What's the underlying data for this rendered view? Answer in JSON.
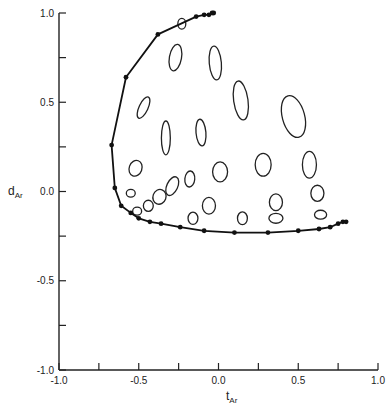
{
  "chart_data": {
    "type": "scatter",
    "title": "",
    "xlabel": "t",
    "xlabel_sub": "Ar",
    "ylabel": "d",
    "ylabel_sub": "Ar",
    "xlim": [
      -1.0,
      1.0
    ],
    "ylim": [
      -1.0,
      1.0
    ],
    "grid": false,
    "x_ticks": [
      -1.0,
      -0.75,
      -0.5,
      -0.25,
      0.0,
      0.25,
      0.5,
      0.75,
      1.0
    ],
    "x_tick_labels": [
      {
        "value": -1.0,
        "label": "-1.0"
      },
      {
        "value": -0.5,
        "label": "-0.5"
      },
      {
        "value": 0.0,
        "label": "0.0"
      },
      {
        "value": 0.5,
        "label": "0.5"
      },
      {
        "value": 1.0,
        "label": "1.0"
      }
    ],
    "y_ticks": [
      -1.0,
      -0.75,
      -0.5,
      -0.25,
      0.0,
      0.25,
      0.5,
      0.75,
      1.0
    ],
    "y_tick_labels": [
      {
        "value": 1.0,
        "label": "1.0"
      },
      {
        "value": 0.5,
        "label": "0.5"
      },
      {
        "value": 0.0,
        "label": "0.0"
      },
      {
        "value": -0.5,
        "label": "-0.5"
      },
      {
        "value": -1.0,
        "label": "-1.0"
      }
    ],
    "series": [
      {
        "name": "boundary curve",
        "kind": "line-with-markers",
        "points": [
          [
            -0.03,
            1.0
          ],
          [
            -0.04,
            1.0
          ],
          [
            -0.06,
            0.99
          ],
          [
            -0.09,
            0.99
          ],
          [
            -0.14,
            0.98
          ],
          [
            -0.38,
            0.88
          ],
          [
            -0.58,
            0.64
          ],
          [
            -0.67,
            0.26
          ],
          [
            -0.65,
            0.02
          ],
          [
            -0.61,
            -0.08
          ],
          [
            -0.55,
            -0.12
          ],
          [
            -0.5,
            -0.15
          ],
          [
            -0.43,
            -0.17
          ],
          [
            -0.36,
            -0.18
          ],
          [
            -0.24,
            -0.2
          ],
          [
            -0.09,
            -0.22
          ],
          [
            0.1,
            -0.23
          ],
          [
            0.31,
            -0.23
          ],
          [
            0.5,
            -0.22
          ],
          [
            0.63,
            -0.21
          ],
          [
            0.7,
            -0.2
          ],
          [
            0.75,
            -0.18
          ],
          [
            0.78,
            -0.17
          ],
          [
            0.8,
            -0.17
          ]
        ]
      },
      {
        "name": "uncertainty ellipses",
        "kind": "ellipses",
        "ellipses": [
          {
            "cx": -0.23,
            "cy": 0.94,
            "rx": 0.025,
            "ry": 0.03,
            "angle": 0
          },
          {
            "cx": -0.27,
            "cy": 0.75,
            "rx": 0.038,
            "ry": 0.075,
            "angle": 10
          },
          {
            "cx": -0.02,
            "cy": 0.72,
            "rx": 0.038,
            "ry": 0.095,
            "angle": -5
          },
          {
            "cx": 0.14,
            "cy": 0.51,
            "rx": 0.045,
            "ry": 0.11,
            "angle": -8
          },
          {
            "cx": 0.47,
            "cy": 0.42,
            "rx": 0.07,
            "ry": 0.12,
            "angle": -15
          },
          {
            "cx": -0.47,
            "cy": 0.47,
            "rx": 0.028,
            "ry": 0.065,
            "angle": 25
          },
          {
            "cx": -0.33,
            "cy": 0.3,
            "rx": 0.028,
            "ry": 0.095,
            "angle": 0
          },
          {
            "cx": -0.11,
            "cy": 0.33,
            "rx": 0.031,
            "ry": 0.075,
            "angle": -5
          },
          {
            "cx": -0.52,
            "cy": 0.13,
            "rx": 0.04,
            "ry": 0.045,
            "angle": 20
          },
          {
            "cx": 0.01,
            "cy": 0.11,
            "rx": 0.047,
            "ry": 0.056,
            "angle": 0
          },
          {
            "cx": 0.28,
            "cy": 0.15,
            "rx": 0.05,
            "ry": 0.064,
            "angle": 0
          },
          {
            "cx": 0.57,
            "cy": 0.15,
            "rx": 0.044,
            "ry": 0.075,
            "angle": 0
          },
          {
            "cx": -0.18,
            "cy": 0.07,
            "rx": 0.031,
            "ry": 0.045,
            "angle": 5
          },
          {
            "cx": -0.29,
            "cy": 0.03,
            "rx": 0.034,
            "ry": 0.056,
            "angle": 25
          },
          {
            "cx": -0.37,
            "cy": -0.03,
            "rx": 0.041,
            "ry": 0.042,
            "angle": 20
          },
          {
            "cx": -0.44,
            "cy": -0.08,
            "rx": 0.031,
            "ry": 0.031,
            "angle": 0
          },
          {
            "cx": -0.55,
            "cy": -0.01,
            "rx": 0.028,
            "ry": 0.022,
            "angle": 0
          },
          {
            "cx": -0.51,
            "cy": -0.11,
            "rx": 0.028,
            "ry": 0.022,
            "angle": 0
          },
          {
            "cx": -0.06,
            "cy": -0.08,
            "rx": 0.041,
            "ry": 0.047,
            "angle": 0
          },
          {
            "cx": -0.16,
            "cy": -0.15,
            "rx": 0.031,
            "ry": 0.034,
            "angle": 0
          },
          {
            "cx": 0.15,
            "cy": -0.15,
            "rx": 0.031,
            "ry": 0.036,
            "angle": 0
          },
          {
            "cx": 0.36,
            "cy": -0.06,
            "rx": 0.041,
            "ry": 0.047,
            "angle": 0
          },
          {
            "cx": 0.36,
            "cy": -0.15,
            "rx": 0.044,
            "ry": 0.028,
            "angle": 0
          },
          {
            "cx": 0.62,
            "cy": -0.01,
            "rx": 0.041,
            "ry": 0.045,
            "angle": 0
          },
          {
            "cx": 0.64,
            "cy": -0.13,
            "rx": 0.038,
            "ry": 0.025,
            "angle": 0
          }
        ]
      }
    ]
  },
  "layout": {
    "plot_px": {
      "x0": 59,
      "x1": 378,
      "y_top": 13,
      "y_bottom": 370
    }
  }
}
